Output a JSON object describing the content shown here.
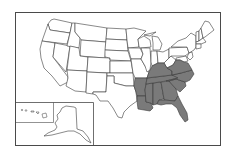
{
  "map": {
    "type": "choropleth",
    "region": "United States",
    "highlight_color": "#7a7a7a",
    "base_color": "#ffffff",
    "border_color": "#3a3a3a",
    "highlighted_states": [
      "Arkansas",
      "Louisiana",
      "Mississippi",
      "Alabama",
      "Tennessee",
      "Kentucky",
      "Georgia",
      "Florida",
      "South Carolina",
      "North Carolina",
      "Virginia"
    ],
    "insets": [
      "Alaska",
      "Hawaii"
    ]
  }
}
